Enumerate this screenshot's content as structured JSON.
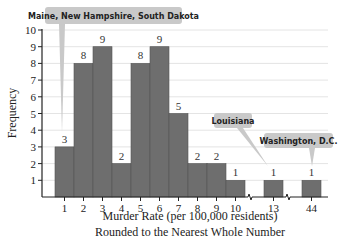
{
  "chart_data": {
    "type": "bar",
    "title": "",
    "xlabel": "Murder Rate (per 100,000 residents)",
    "xlabel_line2": "Rounded to the Nearest Whole Number",
    "ylabel": "Frequency",
    "ylim": [
      0,
      10
    ],
    "yticks": [
      1,
      2,
      3,
      4,
      5,
      6,
      7,
      8,
      9,
      10
    ],
    "grid": true,
    "categories": [
      "1",
      "2",
      "3",
      "4",
      "5",
      "6",
      "7",
      "8",
      "9",
      "10",
      "13",
      "44"
    ],
    "values": [
      3,
      8,
      9,
      2,
      8,
      9,
      5,
      2,
      2,
      1,
      1,
      1
    ],
    "axis_breaks_after": [
      "10",
      "13"
    ],
    "annotations": [
      {
        "text": "Maine, New Hampshire, South Dakota",
        "points_to": "1"
      },
      {
        "text": "Louisiana",
        "points_to": "13"
      },
      {
        "text": "Washington, D.C.",
        "points_to": "44"
      }
    ],
    "colors": {
      "bar": "#6e6e6e",
      "callout": "#c9c9c9",
      "grid": "#e4e4e4"
    }
  }
}
